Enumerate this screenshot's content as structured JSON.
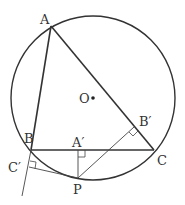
{
  "diagram": {
    "colors": {
      "stroke": "#333333",
      "thin": "#555555",
      "background": "#ffffff"
    },
    "circle": {
      "center": [
        93,
        98
      ],
      "r": 82
    },
    "points": {
      "A": {
        "label": "A",
        "x": 51,
        "y": 26
      },
      "B": {
        "label": "B",
        "x": 31,
        "y": 150
      },
      "C": {
        "label": "C",
        "x": 154,
        "y": 150
      },
      "P": {
        "label": "P",
        "x": 78,
        "y": 178
      },
      "A1": {
        "label": "A′",
        "x": 78,
        "y": 150
      },
      "B1": {
        "label": "B′",
        "x": 134,
        "y": 127
      },
      "C1": {
        "label": "C′",
        "x": 29,
        "y": 167
      },
      "O": {
        "label": "O",
        "x": 93,
        "y": 98
      }
    },
    "labels": {
      "A": "A",
      "B": "B",
      "C": "C",
      "P": "P",
      "A1": "A′",
      "B1": "B′",
      "C1": "C′",
      "O": "O"
    }
  }
}
